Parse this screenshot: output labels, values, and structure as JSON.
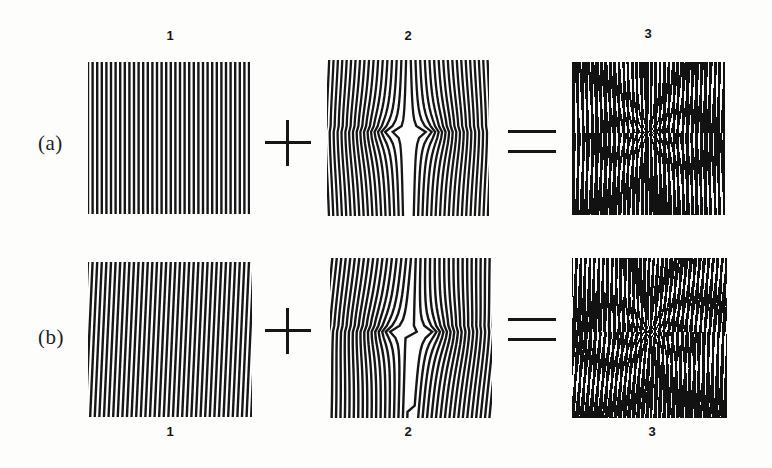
{
  "figure": {
    "background_color": "#fdfdfc",
    "ink_color": "#161616",
    "rows": [
      {
        "id": "a",
        "label": "(a)",
        "label_position": "left",
        "caption_position": "top",
        "panels": [
          {
            "caption": "1",
            "kind": "reference-grating",
            "description": "uniform vertical line grating"
          },
          {
            "caption": "2",
            "kind": "specimen-grating",
            "description": "vertical line grating with V-shaped displacement discontinuity at center"
          },
          {
            "caption": "3",
            "kind": "moire-pattern",
            "description": "resulting moire fringe pattern, coarse vertical fringes"
          }
        ],
        "operators": [
          "+",
          "="
        ]
      },
      {
        "id": "b",
        "label": "(b)",
        "label_position": "left",
        "caption_position": "bottom",
        "panels": [
          {
            "caption": "1",
            "kind": "reference-grating",
            "description": "tilted line grating, rotated slightly from vertical"
          },
          {
            "caption": "2",
            "kind": "specimen-grating",
            "description": "tilted line grating with V-shaped displacement discontinuity at center"
          },
          {
            "caption": "3",
            "kind": "moire-pattern",
            "description": "resulting moire fringe pattern, horizontal banded fringes"
          }
        ],
        "operators": [
          "+",
          "="
        ]
      }
    ],
    "operator_plus": "+",
    "operator_equals": "="
  },
  "chart_data": {
    "type": "image-grid",
    "title": "",
    "rows": [
      "(a)",
      "(b)"
    ],
    "columns": [
      "1",
      "2",
      "3"
    ]
  }
}
